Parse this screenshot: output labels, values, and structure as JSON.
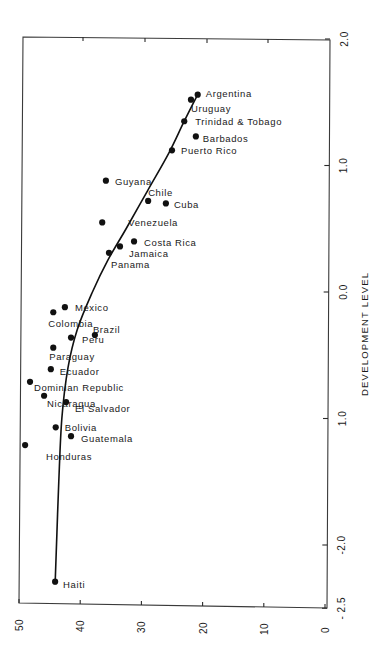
{
  "chart_data": {
    "type": "scatter",
    "title": "",
    "orientation_note": "figure printed rotated 90 degrees clockwise",
    "xlabel": "",
    "ylabel": "DEVELOPMENT LEVEL",
    "x_axis": {
      "ticks": [
        50,
        40,
        30,
        20,
        10,
        0
      ],
      "tick_labels": [
        "50",
        "40",
        "30",
        "20",
        "10",
        "0"
      ],
      "range": [
        50,
        0
      ]
    },
    "y_axis": {
      "label": "DEVELOPMENT LEVEL",
      "ticks": [
        2.0,
        1.0,
        0.0,
        -1.0,
        -2.0,
        -2.5
      ],
      "tick_labels": [
        "2.0",
        "1.0",
        "0.0",
        "1.0",
        "-2.0",
        "- 2.5"
      ],
      "range": [
        -2.5,
        2.0
      ]
    },
    "grid": false,
    "legend": null,
    "points": [
      {
        "label": "Argentina",
        "x": 20.8,
        "y": 1.56
      },
      {
        "label": "Uruguay",
        "x": 21.9,
        "y": 1.52
      },
      {
        "label": "Trinidad & Tobago",
        "x": 23.0,
        "y": 1.35
      },
      {
        "label": "Barbados",
        "x": 21.1,
        "y": 1.23
      },
      {
        "label": "Puerto Rico",
        "x": 25.0,
        "y": 1.12
      },
      {
        "label": "Guyana",
        "x": 35.8,
        "y": 0.88
      },
      {
        "label": "Chile",
        "x": 28.9,
        "y": 0.72
      },
      {
        "label": "Cuba",
        "x": 26.0,
        "y": 0.7
      },
      {
        "label": "Venezuela",
        "x": 36.4,
        "y": 0.55
      },
      {
        "label": "Costa Rica",
        "x": 31.2,
        "y": 0.4
      },
      {
        "label": "Jamaica",
        "x": 33.5,
        "y": 0.36
      },
      {
        "label": "Panama",
        "x": 35.3,
        "y": 0.31
      },
      {
        "label": "Mexico",
        "x": 42.5,
        "y": -0.12
      },
      {
        "label": "Colombia",
        "x": 44.4,
        "y": -0.16
      },
      {
        "label": "Brazil",
        "x": 37.6,
        "y": -0.34
      },
      {
        "label": "Peru",
        "x": 41.5,
        "y": -0.36
      },
      {
        "label": "Paraguay",
        "x": 44.4,
        "y": -0.44
      },
      {
        "label": "Ecuador",
        "x": 44.8,
        "y": -0.61
      },
      {
        "label": "Dominian Republic",
        "x": 48.2,
        "y": -0.71
      },
      {
        "label": "Nicaragua",
        "x": 45.9,
        "y": -0.82
      },
      {
        "label": "El Salvador",
        "x": 42.3,
        "y": -0.87
      },
      {
        "label": "Bolivia",
        "x": 44.0,
        "y": -1.07
      },
      {
        "label": "Guatemala",
        "x": 41.5,
        "y": -1.14
      },
      {
        "label": "Honduras",
        "x": 49.0,
        "y": -1.21
      },
      {
        "label": "Haiti",
        "x": 44.1,
        "y": -2.29
      }
    ],
    "fitted_curve": [
      {
        "x": 44.1,
        "y": -2.31
      },
      {
        "x": 43.8,
        "y": -1.9
      },
      {
        "x": 43.5,
        "y": -1.5
      },
      {
        "x": 43.0,
        "y": -1.0
      },
      {
        "x": 42.0,
        "y": -0.6
      },
      {
        "x": 40.5,
        "y": -0.3
      },
      {
        "x": 38.0,
        "y": 0.0
      },
      {
        "x": 35.5,
        "y": 0.25
      },
      {
        "x": 32.5,
        "y": 0.5
      },
      {
        "x": 29.0,
        "y": 0.8
      },
      {
        "x": 25.5,
        "y": 1.1
      },
      {
        "x": 23.0,
        "y": 1.35
      },
      {
        "x": 20.6,
        "y": 1.58
      }
    ]
  },
  "labels": {
    "axis_title": "DEVELOPMENT LEVEL"
  }
}
